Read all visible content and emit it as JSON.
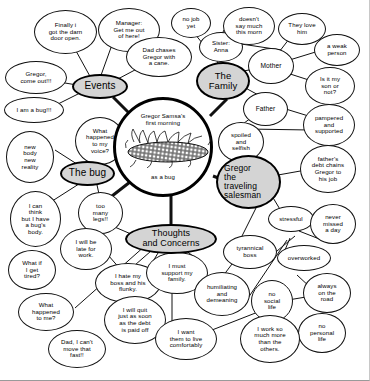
{
  "diagram": {
    "type": "mind-map",
    "center": {
      "line1": "Gregor Samsa's",
      "line2": "first  morning",
      "line3": "as a bug",
      "illustration": "beetle-bug-illustration"
    },
    "hubs": [
      {
        "id": "events",
        "label": "Events"
      },
      {
        "id": "family",
        "label": "The\nFamily"
      },
      {
        "id": "bug",
        "label": "The bug"
      },
      {
        "id": "thoughts",
        "label": "Thoughts\nand Concerns"
      },
      {
        "id": "salesman",
        "label": "Gregor\nthe\ntraveling\nsalesman"
      }
    ],
    "nodes": [
      {
        "id": "n1",
        "text": "Finally  i\ngot the darn\ndoor open."
      },
      {
        "id": "n2",
        "text": "Manager:\nGet me out\nof  here!"
      },
      {
        "id": "n3",
        "text": "Dad chases\nGregor  with\na cane."
      },
      {
        "id": "n4",
        "text": "Gregor,\ncome out!!!"
      },
      {
        "id": "n5",
        "text": "I am a bug!!!"
      },
      {
        "id": "n6",
        "text": "What\nhappened\nto my\nvoice?"
      },
      {
        "id": "n7",
        "text": "new\nbody\nnew\nreality"
      },
      {
        "id": "n8",
        "text": "I can\nthink\nbut I have\na bug's\nbody."
      },
      {
        "id": "n9",
        "text": "too\nmany\nlegs!!"
      },
      {
        "id": "n10",
        "text": "I will be\nlate  for\nwork."
      },
      {
        "id": "n11",
        "text": "What if\nI get\ntired?"
      },
      {
        "id": "n12",
        "text": "What\nhappened\nto me?"
      },
      {
        "id": "n13",
        "text": "Dad, I can't\nmove that\nfast!!"
      },
      {
        "id": "n14",
        "text": "I hate my\nboss and his\nflunky."
      },
      {
        "id": "n15",
        "text": "I will quit\njust as soon\nas the debt\nis paid off"
      },
      {
        "id": "n16",
        "text": "I must\nsupport  my\nfamily."
      },
      {
        "id": "n17",
        "text": "I want\nthem to live\ncomfortably"
      },
      {
        "id": "n18",
        "text": "no job\nyet"
      },
      {
        "id": "n19",
        "text": "Sister:\nAnna"
      },
      {
        "id": "n20",
        "text": "doesn't\nsay much\nthis  morn"
      },
      {
        "id": "n21",
        "text": "They love\nhim"
      },
      {
        "id": "n22",
        "text": "Mother"
      },
      {
        "id": "n23",
        "text": "a weak\nperson"
      },
      {
        "id": "n24",
        "text": "Is it my\nson or\nnot?"
      },
      {
        "id": "n25",
        "text": "Father"
      },
      {
        "id": "n26",
        "text": "pampered\nand\nsupported"
      },
      {
        "id": "n27",
        "text": "spoiled\nand\nselfish"
      },
      {
        "id": "n28",
        "text": "father's\ndebt chains\nGregor to\nhis  job"
      },
      {
        "id": "n29",
        "text": "stressful"
      },
      {
        "id": "n30",
        "text": "never\nmissed\na day"
      },
      {
        "id": "n31",
        "text": "tyrannical\nboss"
      },
      {
        "id": "n32",
        "text": "overworked"
      },
      {
        "id": "n33",
        "text": "humiliating\nand\ndemeaning"
      },
      {
        "id": "n34",
        "text": "no\nsocial\nlife"
      },
      {
        "id": "n35",
        "text": "always\non the\nroad"
      },
      {
        "id": "n36",
        "text": "no\npersonal\nlife"
      },
      {
        "id": "n37",
        "text": "I work so\nmuch more\nthan the\nothers."
      }
    ],
    "colors": {
      "hub_fill": "#d4d4d4",
      "node_fill": "#ffffff",
      "stroke": "#111111",
      "background": "#ffffff"
    }
  }
}
